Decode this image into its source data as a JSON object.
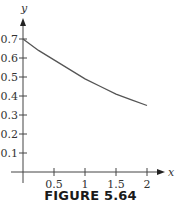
{
  "chart_data": {
    "type": "line",
    "title": "",
    "caption": "FIGURE 5.64",
    "xlabel": "x",
    "ylabel": "y",
    "xlim": [
      0,
      2.15
    ],
    "ylim": [
      0,
      0.75
    ],
    "grid": false,
    "legend": null,
    "x_ticks": [
      0.5,
      1,
      1.5,
      2
    ],
    "x_tick_labels": [
      "0.5",
      "1",
      "1.5",
      "2"
    ],
    "y_ticks": [
      0.1,
      0.2,
      0.3,
      0.4,
      0.5,
      0.6,
      0.7
    ],
    "y_tick_labels": [
      "0.1",
      "0.2",
      "0.3",
      "0.4",
      "0.5",
      "0.6",
      "0.7"
    ],
    "series": [
      {
        "name": "curve",
        "x": [
          0,
          0.25,
          0.5,
          0.75,
          1,
          1.25,
          1.5,
          1.75,
          2
        ],
        "y": [
          0.7,
          0.64,
          0.59,
          0.54,
          0.49,
          0.45,
          0.41,
          0.38,
          0.35
        ]
      }
    ]
  },
  "colors": {
    "axis": "#444444",
    "curve": "#555555",
    "text": "#333333"
  }
}
